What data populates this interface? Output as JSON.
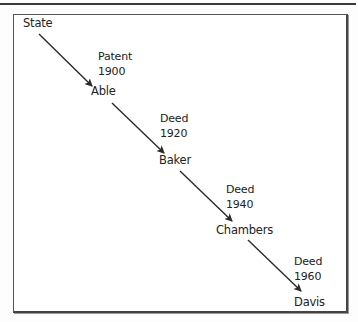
{
  "diagram": {
    "type": "chain-of-title",
    "nodes": [
      {
        "id": "state",
        "label": "State"
      },
      {
        "id": "able",
        "label": "Able"
      },
      {
        "id": "baker",
        "label": "Baker"
      },
      {
        "id": "chambers",
        "label": "Chambers"
      },
      {
        "id": "davis",
        "label": "Davis"
      }
    ],
    "edges": [
      {
        "from": "State",
        "to": "Able",
        "instrument": "Patent",
        "year": "1900"
      },
      {
        "from": "Able",
        "to": "Baker",
        "instrument": "Deed",
        "year": "1920"
      },
      {
        "from": "Baker",
        "to": "Chambers",
        "instrument": "Deed",
        "year": "1940"
      },
      {
        "from": "Chambers",
        "to": "Davis",
        "instrument": "Deed",
        "year": "1960"
      }
    ]
  },
  "colors": {
    "text": "#222222",
    "arrow": "#2a2a2a",
    "border": "#444444",
    "background": "#ffffff"
  }
}
